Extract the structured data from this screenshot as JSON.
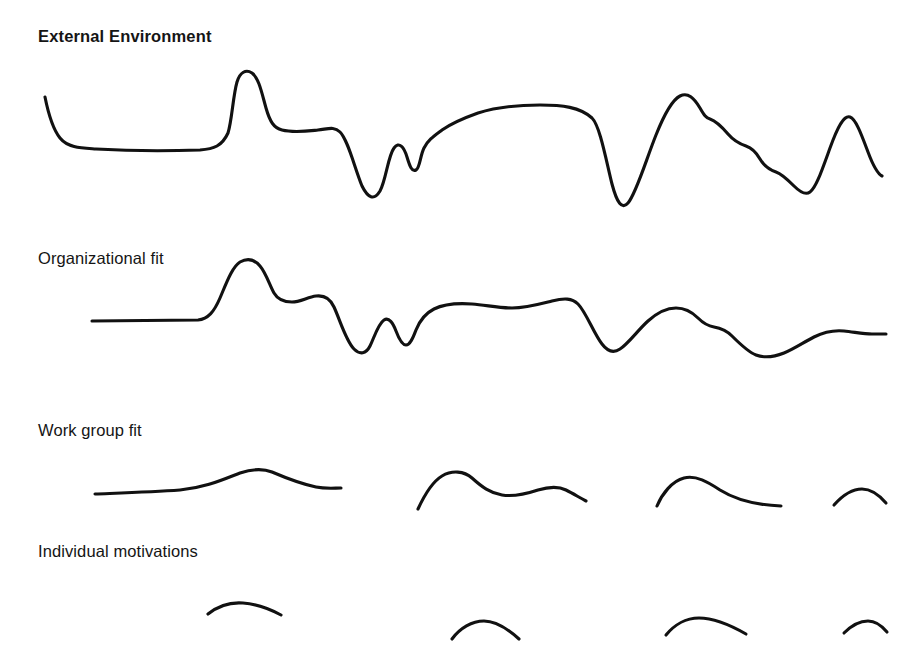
{
  "figure": {
    "background_color": "#ffffff",
    "line_color": "#111111",
    "text_color": "#151515",
    "line_width_px": 3.1,
    "width_px": 919,
    "height_px": 672
  },
  "rows": [
    {
      "id": "external-environment",
      "label": "External Environment",
      "emphasis": "bold",
      "label_position": {
        "x": 38,
        "y": 27
      },
      "description": "Continuous high-amplitude wave spanning the full width with many peaks and deep valleys"
    },
    {
      "id": "organizational-fit",
      "label": "Organizational fit",
      "emphasis": "regular",
      "label_position": {
        "x": 38,
        "y": 249
      },
      "description": "Continuous wave of reduced amplitude, flat at left then undulating across the width"
    },
    {
      "id": "work-group-fit",
      "label": "Work group fit",
      "emphasis": "regular",
      "label_position": {
        "x": 38,
        "y": 421
      },
      "description": "Four separated low-amplitude arc segments"
    },
    {
      "id": "individual-motivations",
      "label": "Individual motivations",
      "emphasis": "regular",
      "label_position": {
        "x": 38,
        "y": 542
      },
      "description": "Four short shallow arcs, smallest amplitude, partially cropped at the bottom edge"
    }
  ],
  "chart_data": {
    "type": "line",
    "title": "External Environment",
    "xlabel": "",
    "ylabel": "",
    "grid": false,
    "legend": "none",
    "axes_visible": false,
    "note": "Four stacked signal traces representing nested levels of variation; amplitude decreases from top (External Environment) to bottom (Individual motivations).",
    "series": [
      {
        "name": "External Environment",
        "row": 1,
        "continuous": true,
        "amplitude_rank": 1,
        "x_start": 45,
        "x_end": 882,
        "baseline_y": 148,
        "path": "M45,97 C48,112 52,128 60,138 C68,148 82,148 96,149 C130,151 170,151 200,150 C214,149 222,146 228,133 C232,120 233,96 237,82 C240,72 246,69 252,73 C259,78 262,94 266,108 C270,122 274,128 282,130 C294,133 308,131 318,130 C328,129 334,126 340,132 C348,140 354,166 362,186 C368,198 374,201 380,191 C386,180 388,156 394,148 C399,141 404,147 407,157 C410,167 412,172 416,170 C420,168 420,156 424,148 C428,140 434,136 442,130 C452,123 464,118 478,113 C494,108 516,105 540,105 C562,105 580,107 592,118 C600,126 606,160 612,184 C617,203 622,210 628,203 C636,194 646,160 656,135 C664,115 672,100 680,96 C688,92 694,98 700,108 C704,115 706,118 710,119 C716,121 722,127 728,134 C734,141 740,144 746,146 C752,148 756,152 760,159 C764,166 770,170 776,172 C782,174 788,180 794,186 C800,192 806,195 810,192 C816,188 822,170 830,148 C838,126 844,115 850,117 C856,119 862,136 868,152 C874,168 878,174 882,176",
        "key_points": [
          {
            "x": 45,
            "y": 97,
            "type": "start"
          },
          {
            "x": 96,
            "y": 149,
            "type": "valley"
          },
          {
            "x": 237,
            "y": 70,
            "type": "peak"
          },
          {
            "x": 266,
            "y": 108,
            "type": "shoulder"
          },
          {
            "x": 318,
            "y": 130,
            "type": "plateau"
          },
          {
            "x": 363,
            "y": 196,
            "type": "valley"
          },
          {
            "x": 388,
            "y": 143,
            "type": "peak"
          },
          {
            "x": 402,
            "y": 165,
            "type": "valley"
          },
          {
            "x": 412,
            "y": 145,
            "type": "peak"
          },
          {
            "x": 540,
            "y": 105,
            "type": "plateau"
          },
          {
            "x": 611,
            "y": 210,
            "type": "valley"
          },
          {
            "x": 680,
            "y": 95,
            "type": "peak"
          },
          {
            "x": 710,
            "y": 118,
            "type": "step"
          },
          {
            "x": 735,
            "y": 135,
            "type": "step"
          },
          {
            "x": 757,
            "y": 150,
            "type": "step"
          },
          {
            "x": 777,
            "y": 168,
            "type": "step"
          },
          {
            "x": 807,
            "y": 190,
            "type": "valley"
          },
          {
            "x": 848,
            "y": 117,
            "type": "peak"
          },
          {
            "x": 882,
            "y": 176,
            "type": "end"
          }
        ]
      },
      {
        "name": "Organizational fit",
        "row": 2,
        "continuous": true,
        "amplitude_rank": 2,
        "x_start": 92,
        "x_end": 886,
        "baseline_y": 321,
        "path": "M92,321 L198,320 C208,319 214,312 220,298 C226,284 232,267 240,262 C247,258 254,259 260,266 C266,273 270,286 274,293 C278,300 284,302 292,302 C300,302 308,297 316,296 C324,295 330,298 334,307 C340,320 346,341 354,349 C360,355 366,354 370,346 C374,338 378,324 384,320 C389,317 393,323 396,331 C399,339 402,345 406,345 C410,345 413,338 416,330 C420,320 426,313 434,309 C444,304 458,303 472,304 C486,305 498,308 512,308 C526,308 540,304 552,301 C564,298 572,298 578,304 C586,312 594,334 602,344 C608,352 614,353 620,349 C628,344 638,330 648,321 C658,312 668,308 676,308 C684,308 692,312 698,318 C703,323 708,326 714,327 C720,328 726,330 732,336 C740,344 748,352 756,355 C764,358 774,357 784,353 C794,349 804,342 814,337 C824,332 834,330 844,331 C854,332 864,334 872,334 C878,334 882,334 886,334",
        "key_points": [
          {
            "x": 92,
            "y": 321,
            "type": "start"
          },
          {
            "x": 198,
            "y": 320,
            "type": "flat-end"
          },
          {
            "x": 248,
            "y": 260,
            "type": "peak"
          },
          {
            "x": 292,
            "y": 302,
            "type": "shoulder"
          },
          {
            "x": 316,
            "y": 296,
            "type": "hump"
          },
          {
            "x": 365,
            "y": 352,
            "type": "valley"
          },
          {
            "x": 395,
            "y": 318,
            "type": "peak"
          },
          {
            "x": 406,
            "y": 345,
            "type": "valley"
          },
          {
            "x": 440,
            "y": 306,
            "type": "shoulder"
          },
          {
            "x": 512,
            "y": 308,
            "type": "plateau"
          },
          {
            "x": 614,
            "y": 350,
            "type": "valley"
          },
          {
            "x": 700,
            "y": 310,
            "type": "peak"
          },
          {
            "x": 730,
            "y": 327,
            "type": "shoulder"
          },
          {
            "x": 790,
            "y": 355,
            "type": "valley"
          },
          {
            "x": 850,
            "y": 330,
            "type": "peak"
          },
          {
            "x": 886,
            "y": 334,
            "type": "end"
          }
        ]
      },
      {
        "name": "Work group fit",
        "row": 3,
        "continuous": false,
        "amplitude_rank": 3,
        "baseline_y": 492,
        "segments": [
          {
            "x_start": 95,
            "x_end": 341,
            "path": "M95,494 C120,493 152,492 180,490 C204,488 222,480 240,473 C252,469 262,468 272,472 C286,478 302,484 316,487 C326,489 334,488 341,488",
            "key_points": [
              {
                "x": 95,
                "y": 494,
                "type": "start"
              },
              {
                "x": 255,
                "y": 470,
                "type": "peak"
              },
              {
                "x": 341,
                "y": 488,
                "type": "end"
              }
            ]
          },
          {
            "x_start": 418,
            "x_end": 586,
            "path": "M418,509 C424,496 432,482 442,476 C452,470 464,471 472,478 C482,487 490,493 502,495 C514,497 526,494 538,490 C548,487 558,486 566,490 C574,494 580,498 586,501",
            "key_points": [
              {
                "x": 418,
                "y": 509,
                "type": "start"
              },
              {
                "x": 458,
                "y": 472,
                "type": "peak"
              },
              {
                "x": 512,
                "y": 495,
                "type": "valley"
              },
              {
                "x": 556,
                "y": 487,
                "type": "hump"
              },
              {
                "x": 586,
                "y": 501,
                "type": "end"
              }
            ]
          },
          {
            "x_start": 657,
            "x_end": 781,
            "path": "M657,506 C662,494 672,481 684,478 C696,475 708,482 720,490 C736,500 756,505 781,506",
            "key_points": [
              {
                "x": 657,
                "y": 506,
                "type": "start"
              },
              {
                "x": 690,
                "y": 477,
                "type": "peak"
              },
              {
                "x": 781,
                "y": 506,
                "type": "end"
              }
            ]
          },
          {
            "x_start": 834,
            "x_end": 886,
            "path": "M834,505 C842,496 852,489 862,489 C872,489 880,496 886,503",
            "key_points": [
              {
                "x": 834,
                "y": 505,
                "type": "start"
              },
              {
                "x": 862,
                "y": 489,
                "type": "peak"
              },
              {
                "x": 886,
                "y": 503,
                "type": "end"
              }
            ]
          }
        ]
      },
      {
        "name": "Individual motivations",
        "row": 4,
        "continuous": false,
        "amplitude_rank": 4,
        "baseline_y": 625,
        "cropped_at_bottom": true,
        "segments": [
          {
            "x_start": 208,
            "x_end": 281,
            "path": "M208,614 C218,606 230,602 243,603 C256,604 270,609 281,615",
            "key_points": [
              {
                "x": 208,
                "y": 614,
                "type": "start"
              },
              {
                "x": 243,
                "y": 603,
                "type": "peak"
              },
              {
                "x": 281,
                "y": 615,
                "type": "end"
              }
            ]
          },
          {
            "x_start": 452,
            "x_end": 519,
            "path": "M452,639 C460,628 472,621 484,621 C496,621 508,629 519,639",
            "key_points": [
              {
                "x": 452,
                "y": 639,
                "type": "start"
              },
              {
                "x": 485,
                "y": 621,
                "type": "peak"
              },
              {
                "x": 519,
                "y": 639,
                "type": "end"
              }
            ]
          },
          {
            "x_start": 666,
            "x_end": 746,
            "path": "M666,635 C674,625 686,618 699,618 C714,618 732,626 746,634",
            "key_points": [
              {
                "x": 666,
                "y": 635,
                "type": "start"
              },
              {
                "x": 699,
                "y": 618,
                "type": "peak"
              },
              {
                "x": 746,
                "y": 634,
                "type": "end"
              }
            ]
          },
          {
            "x_start": 844,
            "x_end": 887,
            "path": "M844,633 C852,625 860,621 868,621 C876,621 882,626 887,632",
            "key_points": [
              {
                "x": 844,
                "y": 633,
                "type": "start"
              },
              {
                "x": 868,
                "y": 621,
                "type": "peak"
              },
              {
                "x": 887,
                "y": 632,
                "type": "end"
              }
            ]
          }
        ]
      }
    ]
  }
}
